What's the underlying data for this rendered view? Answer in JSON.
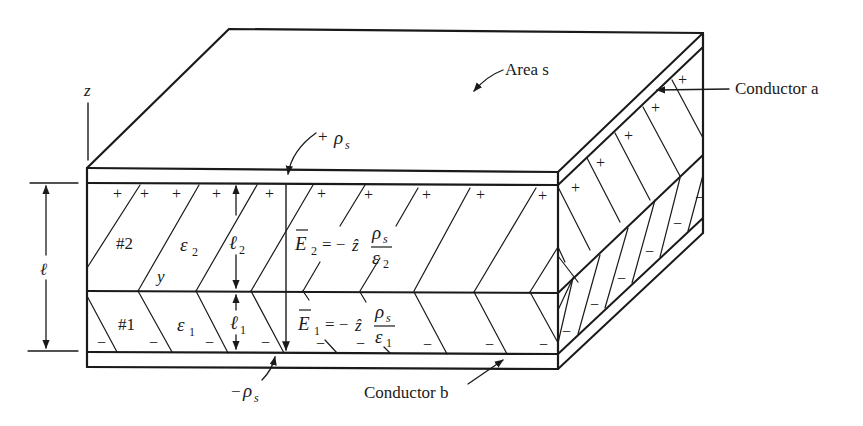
{
  "figure": {
    "type": "parallel-plate capacitor with two dielectric layers (3D cutaway)",
    "stroke_color": "#1a1a1a",
    "background": "#ffffff"
  },
  "labels": {
    "area": "Area s",
    "conductor_a": "Conductor a",
    "conductor_b": "Conductor b",
    "axis_z": "z",
    "axis_y": "y",
    "top_charge": "+ρs",
    "top_charge_sign": "+",
    "top_charge_sym": "ρ",
    "top_charge_sub": "s",
    "bottom_charge_sign": "−",
    "bottom_charge_sym": "ρ",
    "bottom_charge_sub": "s",
    "total_thickness": "ℓ",
    "layer2": {
      "name": "#2",
      "permittivity_sym": "ε",
      "permittivity_sub": "2",
      "thickness_sym": "ℓ",
      "thickness_sub": "2",
      "field_lhs": "E",
      "field_lhs_sub": "2",
      "field_eq": "= −",
      "field_unit": "ẑ",
      "field_num": "ρ",
      "field_num_sub": "s",
      "field_den": "ε",
      "field_den_sub": "2"
    },
    "layer1": {
      "name": "#1",
      "permittivity_sym": "ε",
      "permittivity_sub": "1",
      "thickness_sym": "ℓ",
      "thickness_sub": "1",
      "field_lhs": "E",
      "field_lhs_sub": "1",
      "field_eq": "= −",
      "field_unit": "ẑ",
      "field_num": "ρ",
      "field_num_sub": "s",
      "field_den": "ε",
      "field_den_sub": "1"
    }
  },
  "charges": {
    "positive": "+",
    "negative": "−"
  }
}
